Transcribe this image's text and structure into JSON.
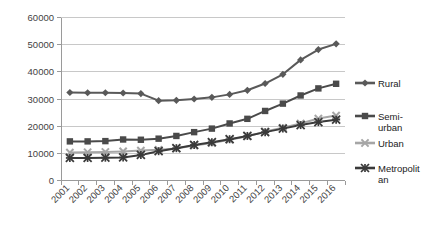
{
  "chart_data": {
    "type": "line",
    "title": "",
    "xlabel": "",
    "ylabel": "",
    "ylim": [
      0,
      60000
    ],
    "ytick_values": [
      0,
      10000,
      20000,
      30000,
      40000,
      50000,
      60000
    ],
    "ytick_labels": [
      "0",
      "10000",
      "20000",
      "30000",
      "40000",
      "50000",
      "60000"
    ],
    "grid": true,
    "legend_position": "right",
    "categories": [
      "2001",
      "2002",
      "2003",
      "2004",
      "2005",
      "2006",
      "2007",
      "2008",
      "2009",
      "2010",
      "2011",
      "2012",
      "2013",
      "2014",
      "2015",
      "2016"
    ],
    "series": [
      {
        "name": "Rural",
        "marker": "diamond",
        "color": "#595959",
        "values": [
          32400,
          32300,
          32300,
          32200,
          32000,
          29400,
          29500,
          30000,
          30600,
          31700,
          33200,
          35700,
          39100,
          44400,
          48200,
          50300
        ]
      },
      {
        "name": "Semi-urban",
        "marker": "square",
        "color": "#4a4a4a",
        "values": [
          14400,
          14400,
          14500,
          15100,
          15000,
          15400,
          16400,
          17800,
          19100,
          21000,
          22700,
          25600,
          28300,
          31300,
          33900,
          35600
        ]
      },
      {
        "name": "Urban",
        "marker": "x",
        "color": "#a6a6a6",
        "values": [
          10300,
          10400,
          10500,
          10700,
          11000,
          11300,
          11800,
          12900,
          13800,
          15000,
          16300,
          18000,
          19400,
          21000,
          22800,
          23900
        ]
      },
      {
        "name": "Metropolitan",
        "marker": "star",
        "color": "#3a3a3a",
        "values": [
          8300,
          8300,
          8400,
          8500,
          9400,
          10800,
          11900,
          13100,
          14100,
          15200,
          16400,
          17800,
          19100,
          20400,
          21500,
          22400
        ]
      }
    ]
  },
  "legend": {
    "entries": [
      {
        "label_line1": "Rural",
        "label_line2": ""
      },
      {
        "label_line1": "Semi-",
        "label_line2": "urban"
      },
      {
        "label_line1": "Urban",
        "label_line2": ""
      },
      {
        "label_line1": "Metropolit",
        "label_line2": "an"
      }
    ]
  },
  "colors": {
    "rural": "#595959",
    "semi_urban": "#4a4a4a",
    "urban": "#a6a6a6",
    "metropolitan": "#3a3a3a",
    "gridline": "#c8c8c8",
    "axis": "#9a9a9a",
    "text": "#3f3f3f",
    "background": "#ffffff"
  }
}
